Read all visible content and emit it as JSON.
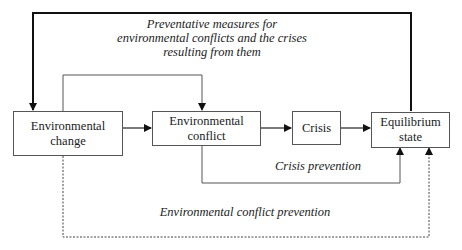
{
  "nodes": [
    {
      "id": "environmental-change",
      "line1": "Environmental",
      "line2": "change"
    },
    {
      "id": "environmental-conflict",
      "line1": "Environmental",
      "line2": "conflict"
    },
    {
      "id": "crisis",
      "line1": "Crisis",
      "line2": ""
    },
    {
      "id": "equilibrium-state",
      "line1": "Equilibrium",
      "line2": "state"
    }
  ],
  "labels": {
    "preventative_line1": "Preventative measures for",
    "preventative_line2": "environmental conflicts and the crises",
    "preventative_line3": "resulting from them",
    "crisis_prevention": "Crisis prevention",
    "env_conflict_prevention": "Environmental conflict prevention"
  },
  "colors": {
    "bold_line": "#111111",
    "thin_line": "#555555",
    "dashed_line": "#444444"
  }
}
